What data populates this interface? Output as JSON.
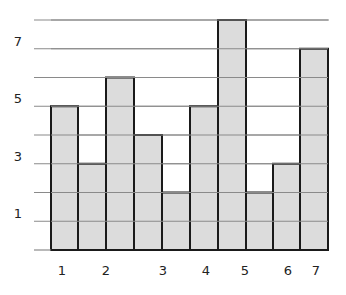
{
  "chart_data": {
    "type": "bar",
    "title": "",
    "xlabel": "",
    "ylabel": "",
    "grid": true,
    "ylim": [
      0,
      8
    ],
    "y_gridlines": [
      1,
      2,
      3,
      4,
      5,
      6,
      7,
      8
    ],
    "y_tick_labels": [
      {
        "value": 1,
        "label": "1"
      },
      {
        "value": 3,
        "label": "3"
      },
      {
        "value": 5,
        "label": "5"
      },
      {
        "value": 7,
        "label": "7"
      }
    ],
    "x_tick_labels": [
      {
        "label": "1",
        "x": 62
      },
      {
        "label": "2",
        "x": 106
      },
      {
        "label": "3",
        "x": 163
      },
      {
        "label": "4",
        "x": 206
      },
      {
        "label": "5",
        "x": 245
      },
      {
        "label": "6",
        "x": 288
      },
      {
        "label": "7",
        "x": 316
      }
    ],
    "bars": [
      {
        "x0": 51,
        "x1": 78,
        "value": 5
      },
      {
        "x0": 78,
        "x1": 106,
        "value": 3
      },
      {
        "x0": 106,
        "x1": 134,
        "value": 6
      },
      {
        "x0": 134,
        "x1": 162,
        "value": 4
      },
      {
        "x0": 162,
        "x1": 190,
        "value": 2
      },
      {
        "x0": 190,
        "x1": 218,
        "value": 5
      },
      {
        "x0": 218,
        "x1": 246,
        "value": 8
      },
      {
        "x0": 246,
        "x1": 273,
        "value": 2
      },
      {
        "x0": 273,
        "x1": 300,
        "value": 3
      },
      {
        "x0": 300,
        "x1": 328,
        "value": 7
      }
    ],
    "values": [
      5,
      3,
      6,
      4,
      2,
      5,
      8,
      2,
      3,
      7
    ],
    "colors": {
      "bar_fill": "#dcdcdc",
      "bar_stroke": "#1a1a1a",
      "gridline": "#8a8a8a",
      "background": "#ffffff"
    }
  }
}
